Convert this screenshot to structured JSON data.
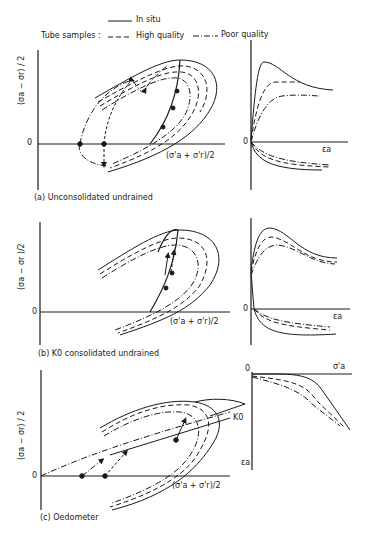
{
  "legend": {
    "in_situ": "In situ",
    "tube_samples": "Tube samples :",
    "high_quality": "High quality",
    "poor_quality": "Poor quality"
  },
  "panels": [
    {
      "id": "a",
      "caption": "(a) Unconsolidated undrained",
      "y_axis_label": "(σa − σr) / 2",
      "x_axis_label": "(σ'a + σ'r)/2",
      "origin_label": "0",
      "strain_axis_label": "εa",
      "strain_origin_label": "0"
    },
    {
      "id": "b",
      "caption": "(b) K0 consolidated undrained",
      "y_axis_label": "(σa − σr )/2",
      "x_axis_label": "(σ'a + σ'r)/2",
      "origin_label": "0",
      "strain_axis_label": "εa",
      "strain_origin_label": "0"
    },
    {
      "id": "c",
      "caption": "(c) Oedometer",
      "y_axis_label": "(σa − σr) / 2",
      "x_axis_label": "(σ'a + σ'r)/2",
      "origin_label": "0",
      "k0_label": "K0",
      "strain_axis_label": "εa",
      "stress_axis_label": "σ'a",
      "strain_origin_label": "0"
    }
  ],
  "colors": {
    "line": "#1a1a1a",
    "background": "#ffffff"
  }
}
